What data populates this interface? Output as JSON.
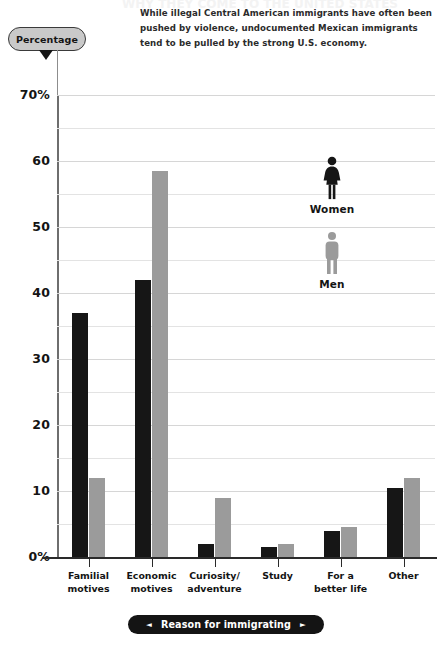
{
  "page_title": "WHY THEY COME TO THE UNITED STATES",
  "caption": {
    "lines": [
      "While illegal Central American immigrants have often been",
      "pushed by violence, undocumented Mexican immigrants",
      "tend to be pulled by the strong U.S. economy."
    ]
  },
  "y_axis": {
    "badge_label": "Percentage",
    "ticks": [
      "70%",
      "60",
      "50",
      "40",
      "30",
      "20",
      "10",
      "0%"
    ]
  },
  "x_axis": {
    "banner_label": "Reason for immigrating",
    "left_arrow": "◄",
    "right_arrow": "►"
  },
  "legend": {
    "items": [
      {
        "label": "Women",
        "color": "#161616",
        "icon": "woman-figure-icon"
      },
      {
        "label": "Men",
        "color": "#9b9b9b",
        "icon": "man-figure-icon"
      }
    ]
  },
  "chart_data": {
    "type": "bar",
    "title": "WHY THEY COME TO THE UNITED STATES",
    "subtitle": "While illegal Central American immigrants have often been pushed by violence, undocumented Mexican immigrants tend to be pulled by the strong U.S. economy.",
    "xlabel": "Reason for immigrating",
    "ylabel": "Percentage",
    "ylim": [
      0,
      70
    ],
    "ytick_values": [
      0,
      10,
      20,
      30,
      40,
      50,
      60,
      70
    ],
    "ytick_labels": [
      "0%",
      "10",
      "20",
      "30",
      "40",
      "50",
      "60",
      "70%"
    ],
    "grid": true,
    "grid_interval": 5,
    "legend_position": "inside-right",
    "categories": [
      [
        "Familial",
        "motives"
      ],
      [
        "Economic",
        "motives"
      ],
      [
        "Curiosity/",
        "adventure"
      ],
      [
        "Study"
      ],
      [
        "For a",
        "better life"
      ],
      [
        "Other"
      ]
    ],
    "category_labels": [
      "Familial motives",
      "Economic motives",
      "Curiosity/adventure",
      "Study",
      "For a better life",
      "Other"
    ],
    "series": [
      {
        "name": "Women",
        "color": "#161616",
        "values": [
          37,
          42,
          2,
          1.5,
          4,
          10.5
        ]
      },
      {
        "name": "Men",
        "color": "#9b9b9b",
        "values": [
          12,
          58.5,
          9,
          2,
          4.5,
          12
        ]
      }
    ]
  }
}
